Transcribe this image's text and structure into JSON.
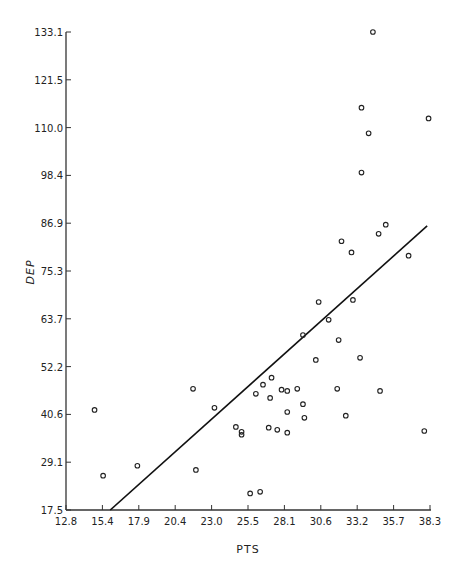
{
  "chart_data": {
    "type": "scatter",
    "title": "",
    "xlabel": "PTS",
    "ylabel": "DEP",
    "xlim": [
      12.8,
      38.3
    ],
    "ylim": [
      17.5,
      133.1
    ],
    "x_ticks": [
      "12.8",
      "15.4",
      "17.9",
      "20.4",
      "23.0",
      "25.5",
      "28.1",
      "30.6",
      "33.2",
      "35.7",
      "38.3"
    ],
    "y_ticks": [
      "17.5",
      "29.1",
      "40.6",
      "52.2",
      "63.7",
      "75.3",
      "86.9",
      "98.4",
      "110.0",
      "121.5",
      "133.1"
    ],
    "grid": false,
    "legend": null,
    "marker": "open-circle",
    "points": [
      [
        14.8,
        41.7
      ],
      [
        15.4,
        25.8
      ],
      [
        17.8,
        28.2
      ],
      [
        21.7,
        46.8
      ],
      [
        21.9,
        27.2
      ],
      [
        23.2,
        42.2
      ],
      [
        24.7,
        37.6
      ],
      [
        25.1,
        36.4
      ],
      [
        25.1,
        35.7
      ],
      [
        25.7,
        21.5
      ],
      [
        26.1,
        45.6
      ],
      [
        26.4,
        21.9
      ],
      [
        26.6,
        47.8
      ],
      [
        27.0,
        37.4
      ],
      [
        27.1,
        44.6
      ],
      [
        27.2,
        49.5
      ],
      [
        27.6,
        36.9
      ],
      [
        27.9,
        46.6
      ],
      [
        28.3,
        36.2
      ],
      [
        28.3,
        41.2
      ],
      [
        28.3,
        46.3
      ],
      [
        29.0,
        46.8
      ],
      [
        29.4,
        43.1
      ],
      [
        29.5,
        39.8
      ],
      [
        29.4,
        59.8
      ],
      [
        30.3,
        53.8
      ],
      [
        30.5,
        67.8
      ],
      [
        31.2,
        63.5
      ],
      [
        31.8,
        46.8
      ],
      [
        31.9,
        58.6
      ],
      [
        32.1,
        82.5
      ],
      [
        32.4,
        40.3
      ],
      [
        32.8,
        79.8
      ],
      [
        32.9,
        68.3
      ],
      [
        33.4,
        54.3
      ],
      [
        33.5,
        114.8
      ],
      [
        33.5,
        99.1
      ],
      [
        34.0,
        108.6
      ],
      [
        34.3,
        133.1
      ],
      [
        34.7,
        84.3
      ],
      [
        34.8,
        46.3
      ],
      [
        35.2,
        86.5
      ],
      [
        36.8,
        79.0
      ],
      [
        38.2,
        112.2
      ],
      [
        37.9,
        36.6
      ]
    ],
    "fit_line": {
      "type": "linear",
      "x": [
        15.9,
        38.1
      ],
      "y": [
        17.5,
        86.2
      ]
    }
  }
}
